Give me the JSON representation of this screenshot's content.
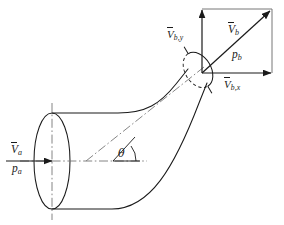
{
  "figure": {
    "name": "control-volume-reducing-elbow-diagram",
    "type": "engineering-diagram",
    "width": 284,
    "height": 225,
    "background_color": "#ffffff",
    "line_color": "#1a1a1a",
    "centerline_color": "#777777"
  },
  "labels": {
    "inlet_velocity": "V",
    "inlet_velocity_sub": "a",
    "inlet_pressure": "p",
    "inlet_pressure_sub": "a",
    "outlet_velocity_y": "V",
    "outlet_velocity_y_sub": "b,y",
    "outlet_velocity": "V",
    "outlet_velocity_sub": "b",
    "outlet_pressure": "p",
    "outlet_pressure_sub": "b",
    "outlet_velocity_x": "V",
    "outlet_velocity_x_sub": "b,x",
    "angle": "θ"
  },
  "geometry": {
    "inlet_ellipse": {
      "cx": 52,
      "cy": 161,
      "rx": 18,
      "ry": 48
    },
    "outlet_ellipse": {
      "cx": 198,
      "cy": 70,
      "rx": 13,
      "ry": 19,
      "rotation": -31
    },
    "horizontal_centerline": {
      "x1": 18,
      "y1": 161,
      "x2": 145,
      "y2": 161
    },
    "vertical_centerline": {
      "x1": 52,
      "y1": 104,
      "x2": 52,
      "y2": 219
    },
    "inclined_centerline": {
      "x1": 88,
      "y1": 161,
      "x2": 203,
      "y2": 68
    },
    "angle_vertex": {
      "x": 113,
      "y": 161
    },
    "angle_degrees": 38,
    "inlet_arrow": {
      "x1": 6,
      "y1": 161,
      "x2": 50,
      "y2": 161
    },
    "vector_box": {
      "left": 202,
      "top": 9,
      "right": 272,
      "bottom": 73
    },
    "resultant_vector": {
      "x1": 202,
      "y1": 73,
      "x2": 270,
      "y2": 11
    },
    "x_component_vector": {
      "x1": 202,
      "y1": 73,
      "x2": 270,
      "y2": 73
    },
    "y_component_vector": {
      "x1": 202,
      "y1": 73,
      "x2": 202,
      "y2": 11
    }
  }
}
